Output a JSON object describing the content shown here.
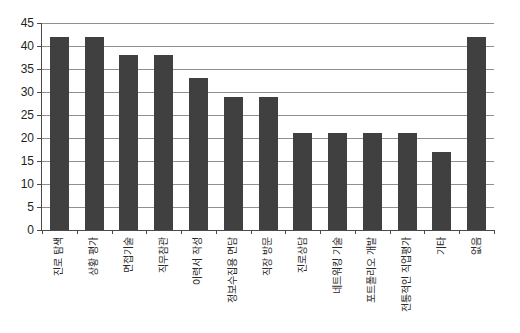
{
  "chart_data": {
    "type": "bar",
    "title": "",
    "xlabel": "",
    "ylabel": "",
    "categories": [
      "진로 탐색",
      "상황 평가",
      "면접기술",
      "직무참관",
      "이력서 작성",
      "정보수집용 면담",
      "직장 방문",
      "진로상담",
      "네트워킹 기술",
      "포트폴리오 개발",
      "전통적인 직업평가",
      "기타",
      "없음"
    ],
    "values": [
      42,
      42,
      38,
      38,
      33,
      29,
      29,
      21,
      21,
      21,
      21,
      17,
      42
    ],
    "ylim": [
      0,
      45
    ],
    "yticks": [
      0,
      5,
      10,
      15,
      20,
      25,
      30,
      35,
      40,
      45
    ],
    "grid": true,
    "legend": false,
    "x_label_rotation": -90,
    "colors": {
      "bar": "#404040",
      "gridline": "#8f8f8f",
      "axis": "#4a4a4a",
      "tick_text": "#1f1f1f",
      "category_text": "#2a2a2a",
      "background": "#ffffff"
    }
  }
}
